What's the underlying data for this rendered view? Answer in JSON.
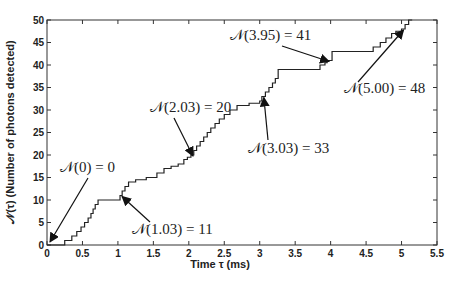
{
  "chart_data": {
    "type": "line",
    "subtype": "step",
    "title": "",
    "xlabel": "Time τ (ms)",
    "ylabel": "𝒩(τ) (Number of photons detected)",
    "xlim": [
      0,
      5.5
    ],
    "ylim": [
      0,
      50
    ],
    "xticks": [
      0,
      0.5,
      1,
      1.5,
      2,
      2.5,
      3,
      3.5,
      4,
      4.5,
      5,
      5.5
    ],
    "xtick_labels": [
      "0",
      "0.5",
      "1",
      "1.5",
      "2",
      "2.5",
      "3",
      "3.5",
      "4",
      "4.5",
      "5",
      "5.5"
    ],
    "yticks": [
      0,
      5,
      10,
      15,
      20,
      25,
      30,
      35,
      40,
      45,
      50
    ],
    "ytick_labels": [
      "0",
      "5",
      "10",
      "15",
      "20",
      "25",
      "30",
      "35",
      "40",
      "45",
      "50"
    ],
    "grid": false,
    "legend": null,
    "series": [
      {
        "name": "N(tau)",
        "x": [
          0,
          0.25,
          0.35,
          0.42,
          0.48,
          0.53,
          0.58,
          0.62,
          0.65,
          0.68,
          0.72,
          1.03,
          1.06,
          1.1,
          1.15,
          1.25,
          1.4,
          1.55,
          1.65,
          1.75,
          1.85,
          1.93,
          1.98,
          2.03,
          2.07,
          2.11,
          2.16,
          2.21,
          2.26,
          2.31,
          2.37,
          2.43,
          2.5,
          2.58,
          2.68,
          2.85,
          3.0,
          3.03,
          3.08,
          3.13,
          3.18,
          3.22,
          3.26,
          3.85,
          3.92,
          3.95,
          4.02,
          4.6,
          4.7,
          4.78,
          4.86,
          4.92,
          5.0,
          5.05,
          5.1,
          5.15
        ],
        "y": [
          0,
          1,
          2,
          3,
          4,
          5,
          6,
          7,
          8,
          9,
          10,
          11,
          12,
          13,
          14,
          14.5,
          15,
          16,
          17,
          17.5,
          18,
          19,
          19.5,
          20,
          21,
          22,
          23,
          24,
          25,
          26,
          27,
          28,
          29,
          30,
          31,
          31.5,
          32,
          33,
          34,
          35,
          36,
          37,
          39,
          40,
          40.5,
          41,
          43,
          44,
          45,
          46,
          47,
          47.5,
          48,
          49,
          50,
          50
        ]
      }
    ],
    "annotations": [
      {
        "text": "𝒩(0) = 0",
        "point": [
          0,
          0
        ]
      },
      {
        "text": "𝒩(1.03) = 11",
        "point": [
          1.03,
          11
        ]
      },
      {
        "text": "𝒩(2.03) = 20",
        "point": [
          2.03,
          20
        ]
      },
      {
        "text": "𝒩(3.03) = 33",
        "point": [
          3.03,
          33
        ]
      },
      {
        "text": "𝒩(3.95) = 41",
        "point": [
          3.95,
          41
        ]
      },
      {
        "text": "𝒩(5.00) = 48",
        "point": [
          5.0,
          48
        ]
      }
    ]
  },
  "labels": {
    "xlabel": "Time τ (ms)",
    "ylabel": "𝒩(τ) (Number of photons detected)",
    "ann0": "𝒩(0) = 0",
    "ann1": "𝒩(1.03) = 11",
    "ann2": "𝒩(2.03) = 20",
    "ann3": "𝒩(3.03) = 33",
    "ann4": "𝒩(3.95) = 41",
    "ann5": "𝒩(5.00) = 48"
  },
  "colors": {
    "line": "#222222",
    "axes": "#333333",
    "background": "#ffffff"
  }
}
